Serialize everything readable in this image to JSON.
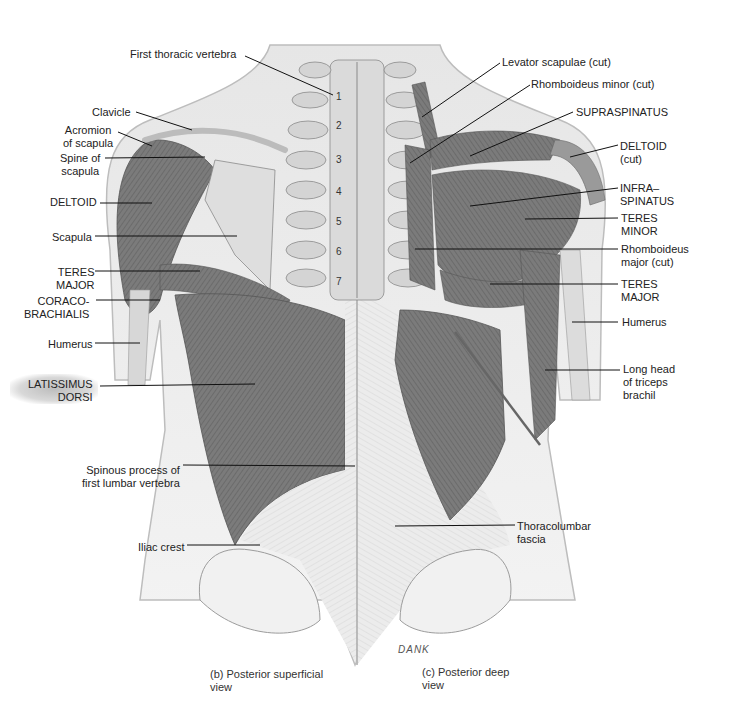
{
  "figure": {
    "left_labels": [
      {
        "id": "first-thoracic-vertebra",
        "text": "First thoracic vertebra",
        "x": 130,
        "y": 48
      },
      {
        "id": "clavicle",
        "text": "Clavicle",
        "x": 92,
        "y": 106
      },
      {
        "id": "acromion",
        "text": "Acromion\nof scapula",
        "x": 63,
        "y": 124
      },
      {
        "id": "spine-of-scapula",
        "text": "Spine of\nscapula",
        "x": 60,
        "y": 152
      },
      {
        "id": "deltoid-left",
        "text": "DELTOID",
        "x": 50,
        "y": 196
      },
      {
        "id": "scapula",
        "text": "Scapula",
        "x": 52,
        "y": 231
      },
      {
        "id": "teres-major-left",
        "text": "TERES\nMAJOR",
        "x": 56,
        "y": 266
      },
      {
        "id": "coracobrachialis",
        "text": "CORACO-\nBRACHIALIS",
        "x": 24,
        "y": 295
      },
      {
        "id": "humerus-left",
        "text": "Humerus",
        "x": 48,
        "y": 338
      },
      {
        "id": "latissimus-dorsi",
        "text": "LATISSIMUS\nDORSI",
        "x": 28,
        "y": 378
      },
      {
        "id": "spinous-process",
        "text": "Spinous process of\nfirst lumbar vertebra",
        "x": 82,
        "y": 464
      },
      {
        "id": "iliac-crest",
        "text": "Iliac crest",
        "x": 138,
        "y": 541
      }
    ],
    "right_labels": [
      {
        "id": "levator-scapulae",
        "text": "Levator scapulae (cut)",
        "x": 502,
        "y": 56
      },
      {
        "id": "rhomboideus-minor",
        "text": "Rhomboideus minor (cut)",
        "x": 531,
        "y": 78
      },
      {
        "id": "supraspinatus",
        "text": "SUPRASPINATUS",
        "x": 576,
        "y": 106
      },
      {
        "id": "deltoid-cut",
        "text": "DELTOID\n(cut)",
        "x": 620,
        "y": 140
      },
      {
        "id": "infraspinatus",
        "text": "INFRA–\nSPINATUS",
        "x": 620,
        "y": 182
      },
      {
        "id": "teres-minor",
        "text": "TERES\nMINOR",
        "x": 621,
        "y": 212
      },
      {
        "id": "rhomboideus-major",
        "text": "Rhomboideus\nmajor (cut)",
        "x": 621,
        "y": 243
      },
      {
        "id": "teres-major-right",
        "text": "TERES\nMAJOR",
        "x": 621,
        "y": 278
      },
      {
        "id": "humerus-right",
        "text": "Humerus",
        "x": 622,
        "y": 316
      },
      {
        "id": "long-head-triceps",
        "text": "Long head\nof triceps\nbrachil",
        "x": 623,
        "y": 363
      },
      {
        "id": "thoracolumbar-fascia",
        "text": "Thoracolumbar\nfascia",
        "x": 517,
        "y": 520
      }
    ],
    "vertebra_numbers": [
      "1",
      "2",
      "3",
      "4",
      "5",
      "6",
      "7"
    ],
    "captions": {
      "left": "(b)  Posterior superficial\n      view",
      "right": "(c)  Posterior deep\n      view"
    },
    "signature": "DANK",
    "colors": {
      "muscle": "#7d7d7d",
      "muscle_dark": "#5e5e5e",
      "bone": "#dcdcdc",
      "skin": "#efefef",
      "fascia": "#e4e4e4",
      "leader_line": "#111111"
    }
  }
}
